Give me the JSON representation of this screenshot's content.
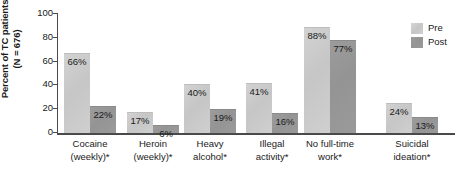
{
  "chart_data": {
    "type": "bar",
    "title": "",
    "xlabel": "",
    "ylabel": "Percent of TC patients (N = 676)",
    "ylabel_line1": "Percent of TC patients",
    "ylabel_line2": "(N = 676)",
    "ylim": [
      0,
      100
    ],
    "yticks": [
      100,
      80,
      60,
      40,
      20,
      0
    ],
    "ytick_labels": [
      "100",
      "80",
      "60",
      "40",
      "20",
      "0"
    ],
    "grid": false,
    "legend_position": "top-right",
    "categories": [
      "Cocaine (weekly)*",
      "Heroin (weekly)*",
      "Heavy alcohol*",
      "Illegal activity*",
      "No full-time work*",
      "Suicidal ideation*"
    ],
    "category_lines": [
      [
        "Cocaine",
        "(weekly)*"
      ],
      [
        "Heroin",
        "(weekly)*"
      ],
      [
        "Heavy",
        "alcohol*"
      ],
      [
        "Illegal",
        "activity*"
      ],
      [
        "No full-time",
        "work*"
      ],
      [
        "Suicidal",
        "ideation*"
      ]
    ],
    "series": [
      {
        "name": "Pre",
        "color": "#c8c8c8",
        "values": [
          66,
          17,
          40,
          41,
          88,
          24
        ],
        "labels": [
          "66%",
          "17%",
          "40%",
          "41%",
          "88%",
          "24%"
        ]
      },
      {
        "name": "Post",
        "color": "#969696",
        "values": [
          22,
          6,
          19,
          16,
          77,
          13
        ],
        "labels": [
          "22%",
          "6%",
          "19%",
          "16%",
          "77%",
          "13%"
        ]
      }
    ]
  },
  "legend": {
    "items": [
      {
        "label": "Pre",
        "swatch": "pre"
      },
      {
        "label": "Post",
        "swatch": "post"
      }
    ]
  }
}
